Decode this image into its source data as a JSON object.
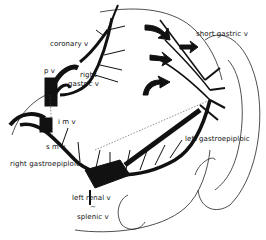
{
  "diagram": {
    "labels": {
      "coronary_v": "coronary v",
      "pv": "p v",
      "right_gastric_v_line1": "right",
      "right_gastric_v_line2": "gastric v",
      "imv": "i m v",
      "smv": "s m v",
      "right_gastroepiploic": "right gastroepiploic",
      "short_gastric_v": "short gastric v",
      "left_gastroepiploic": "left gastroepiploic",
      "left_renal_v": "left renal v",
      "tilde": "~",
      "splenic_v": "splenic v"
    },
    "colors": {
      "ink": "#111111",
      "background": "#ffffff"
    }
  }
}
